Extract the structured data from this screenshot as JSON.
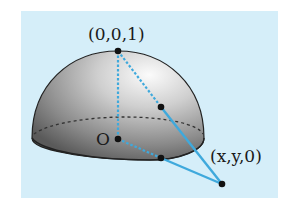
{
  "diagram": {
    "type": "stereographic-projection-hemisphere",
    "labels": {
      "north_pole": "(0,0,1)",
      "origin": "O",
      "plane_point": "(x,y,0)"
    },
    "points": [
      {
        "name": "north_pole",
        "label": "(0,0,1)",
        "x": 118,
        "y": 51
      },
      {
        "name": "sphere_point",
        "label": "",
        "x": 161,
        "y": 107
      },
      {
        "name": "origin",
        "label": "O",
        "x": 118,
        "y": 139
      },
      {
        "name": "equator_point",
        "label": "",
        "x": 161,
        "y": 158
      },
      {
        "name": "plane_point",
        "label": "(x,y,0)",
        "x": 222,
        "y": 184
      }
    ],
    "colors": {
      "background": "#d5eef9",
      "line": "#3fa9dc",
      "hemisphere_dark": "#5c5c5c",
      "hemisphere_light": "#f2f2f2",
      "outline": "#222222",
      "point": "#111111"
    }
  }
}
